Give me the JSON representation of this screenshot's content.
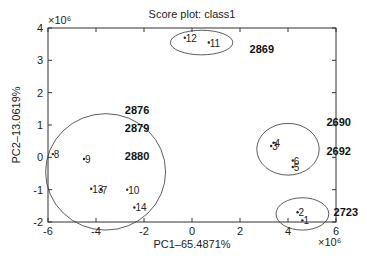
{
  "chart_data": {
    "type": "scatter",
    "title": "Score plot: class1",
    "xlabel": "PC1–65.4871%",
    "ylabel": "PC2–13.0619%",
    "x_exponent": "×10⁶",
    "y_exponent": "×10⁶",
    "xlim": [
      -6,
      6
    ],
    "ylim": [
      -2,
      4
    ],
    "x_ticks": [
      -6,
      -4,
      -2,
      0,
      2,
      4,
      6
    ],
    "y_ticks": [
      -2,
      -1,
      0,
      1,
      2,
      3,
      4
    ],
    "grid": false,
    "points": [
      {
        "label": "1",
        "x": 4.6,
        "y": -1.95
      },
      {
        "label": "2",
        "x": 4.4,
        "y": -1.7
      },
      {
        "label": "3",
        "x": 3.3,
        "y": 0.35
      },
      {
        "label": "4",
        "x": 3.4,
        "y": 0.45
      },
      {
        "label": "5",
        "x": 4.2,
        "y": -0.3
      },
      {
        "label": "6",
        "x": 4.2,
        "y": -0.1
      },
      {
        "label": "7",
        "x": -3.8,
        "y": -1.0
      },
      {
        "label": "8",
        "x": -5.8,
        "y": 0.1
      },
      {
        "label": "9",
        "x": -4.5,
        "y": -0.05
      },
      {
        "label": "10",
        "x": -2.7,
        "y": -1.0
      },
      {
        "label": "11",
        "x": 0.7,
        "y": 3.55
      },
      {
        "label": "12",
        "x": -0.3,
        "y": 3.7
      },
      {
        "label": "13",
        "x": -4.2,
        "y": -0.97
      },
      {
        "label": "14",
        "x": -2.4,
        "y": -1.55
      }
    ],
    "clusters": [
      {
        "cx": 0.4,
        "cy": 3.55,
        "rx": 1.3,
        "ry": 0.38,
        "label": "2869"
      },
      {
        "cx": -3.6,
        "cy": -0.45,
        "rx": 2.5,
        "ry": 1.8,
        "labels": [
          "2876",
          "2879",
          "2880"
        ]
      },
      {
        "cx": 4.0,
        "cy": 0.25,
        "rx": 1.3,
        "ry": 0.8,
        "labels": [
          "2690",
          "2692"
        ]
      },
      {
        "cx": 4.6,
        "cy": -1.75,
        "rx": 1.1,
        "ry": 0.5,
        "label": "2723"
      }
    ],
    "annotations": [
      {
        "text": "2869",
        "x": 2.4,
        "y": 3.35
      },
      {
        "text": "2876",
        "x": -2.8,
        "y": 1.45
      },
      {
        "text": "2879",
        "x": -2.8,
        "y": 0.9
      },
      {
        "text": "2880",
        "x": -2.8,
        "y": 0.05
      },
      {
        "text": "2690",
        "x": 5.6,
        "y": 1.1
      },
      {
        "text": "2692",
        "x": 5.6,
        "y": 0.2
      },
      {
        "text": "2723",
        "x": 5.9,
        "y": -1.7
      }
    ]
  }
}
